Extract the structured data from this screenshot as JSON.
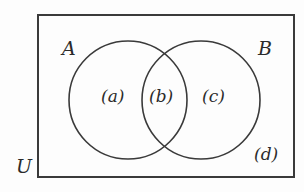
{
  "diagram": {
    "type": "venn-two-set",
    "colors": {
      "background": "#fdfdfd",
      "stroke": "#3a3a3a",
      "text": "#2b2b2b"
    },
    "universe": {
      "label": "U",
      "shape": "rectangle",
      "x": 38,
      "y": 15,
      "width": 256,
      "height": 162,
      "label_x": 16,
      "label_y": 157
    },
    "sets": [
      {
        "id": "set-a",
        "label": "A",
        "cx": 128,
        "cy": 100,
        "r": 59,
        "label_x": 62,
        "label_y": 39
      },
      {
        "id": "set-b",
        "label": "B",
        "cx": 201,
        "cy": 100,
        "r": 59,
        "label_x": 258,
        "label_y": 39
      }
    ],
    "regions": [
      {
        "id": "region-a-only",
        "label": "(a)",
        "description": "A only",
        "x": 101,
        "y": 88
      },
      {
        "id": "region-intersection",
        "label": "(b)",
        "description": "A intersect B",
        "x": 149,
        "y": 88
      },
      {
        "id": "region-b-only",
        "label": "(c)",
        "description": "B only",
        "x": 202,
        "y": 88
      },
      {
        "id": "region-outside",
        "label": "(d)",
        "description": "Outside both sets, inside U",
        "x": 254,
        "y": 146
      }
    ]
  }
}
